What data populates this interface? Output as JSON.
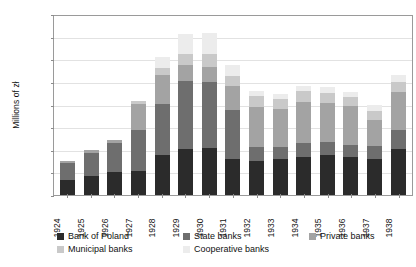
{
  "chart_data": {
    "type": "bar",
    "stacked": true,
    "title": "",
    "xlabel": "",
    "ylabel": "Millions of zł",
    "ylim": [
      0,
      4000
    ],
    "ytick_step": 500,
    "ytick_labels": [
      "0",
      "500",
      "1,000",
      "1,500",
      "2,000",
      "2,500",
      "3,000",
      "3,500",
      "4,000"
    ],
    "grid": true,
    "legend_position": "bottom",
    "categories": [
      "1924",
      "1925",
      "1926",
      "1927",
      "1928",
      "1929",
      "1930",
      "1931",
      "1932",
      "1933",
      "1934",
      "1935",
      "1936",
      "1937",
      "1938"
    ],
    "series": [
      {
        "name": "Bank of Poland",
        "color": "#2b2b2b",
        "values": [
          330,
          430,
          500,
          540,
          880,
          1020,
          1030,
          800,
          760,
          800,
          830,
          890,
          840,
          790,
          1020
        ]
      },
      {
        "name": "State banks",
        "color": "#6e6e6e",
        "values": [
          380,
          500,
          640,
          900,
          1140,
          1510,
          1460,
          1080,
          310,
          270,
          320,
          290,
          270,
          290,
          420
        ]
      },
      {
        "name": "Private banks",
        "color": "#a3a3a3",
        "values": [
          40,
          60,
          80,
          580,
          640,
          340,
          340,
          530,
          880,
          830,
          900,
          860,
          850,
          570,
          830
        ]
      },
      {
        "name": "Municipal banks",
        "color": "#c9c9c9",
        "values": [
          0,
          0,
          0,
          60,
          150,
          250,
          280,
          220,
          230,
          230,
          240,
          220,
          200,
          210,
          230
        ]
      },
      {
        "name": "Cooperative banks",
        "color": "#ececec",
        "values": [
          0,
          0,
          0,
          0,
          230,
          450,
          480,
          240,
          120,
          110,
          120,
          120,
          120,
          130,
          160
        ]
      }
    ]
  },
  "axis": {
    "ylabel": "Millions of zł"
  },
  "legend": {
    "items": [
      {
        "label": "Bank of Poland",
        "color": "#2b2b2b"
      },
      {
        "label": "State banks",
        "color": "#6e6e6e"
      },
      {
        "label": "Private banks",
        "color": "#a3a3a3"
      },
      {
        "label": "Municipal banks",
        "color": "#c9c9c9"
      },
      {
        "label": "Cooperative banks",
        "color": "#ececec"
      }
    ]
  }
}
